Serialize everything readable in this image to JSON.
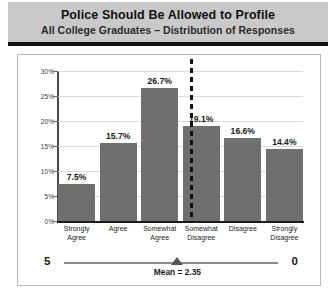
{
  "header": {
    "title": "Police Should Be Allowed to Profile",
    "subtitle": "All College Graduates – Distribution of Responses"
  },
  "scale": {
    "left_end": "5",
    "right_end": "0",
    "mean_label": "Mean = 2.35",
    "mean_value": 2.35,
    "marker_name": "mean-marker"
  },
  "colors": {
    "bar": "#6f6f6f",
    "header_band": "#c9c9c9",
    "header_rule": "#141414",
    "gridline": "#dcdcdc",
    "divider": "#111111",
    "frame_border": "#b9b9b9"
  },
  "chart_data": {
    "type": "bar",
    "title": "Police Should Be Allowed to Profile",
    "subtitle": "All College Graduates – Distribution of Responses",
    "categories": [
      "Strongly\nAgree",
      "Agree",
      "Somewhat\nAgree",
      "Somewhat\nDisagree",
      "Disagree",
      "Strongly\nDisagree"
    ],
    "values": [
      7.5,
      15.7,
      26.7,
      19.1,
      16.6,
      14.4
    ],
    "data_labels": [
      "7.5%",
      "15.7%",
      "26.7%",
      "19.1%",
      "16.6%",
      "14.4%"
    ],
    "xlabel": "",
    "ylabel": "",
    "ylim": [
      0,
      30
    ],
    "yticks": [
      0,
      5,
      10,
      15,
      20,
      25,
      30
    ],
    "ytick_labels": [
      "0%",
      "5%",
      "10%",
      "15%",
      "20%",
      "25%",
      "30%"
    ],
    "grid": true,
    "legend": false,
    "annotations": [
      {
        "type": "vertical-dashed-line",
        "name": "midpoint-divider",
        "position_between": [
          "Somewhat Agree",
          "Somewhat Disagree"
        ]
      },
      {
        "type": "scale-axis",
        "name": "agreement-scale",
        "left": "5",
        "right": "0",
        "marker": "Mean = 2.35"
      }
    ]
  }
}
